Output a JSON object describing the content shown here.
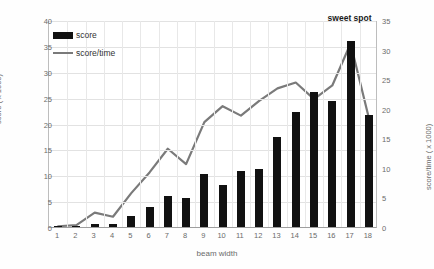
{
  "chart_data": {
    "type": "bar",
    "title": "",
    "xlabel": "beam width",
    "ylabel": "score ( x 1000)",
    "y2label": "score/time ( x 1000)",
    "categories": [
      1,
      2,
      3,
      4,
      5,
      6,
      7,
      8,
      9,
      10,
      11,
      12,
      13,
      14,
      15,
      16,
      17,
      18
    ],
    "xtick_labels": [
      "1",
      "2",
      "3",
      "4",
      "5",
      "6",
      "7",
      "8",
      "9",
      "10",
      "11",
      "12",
      "13",
      "14",
      "15",
      "16",
      "17",
      "18"
    ],
    "ylim": [
      0,
      40
    ],
    "y_ticks": [
      0,
      5,
      10,
      15,
      20,
      25,
      30,
      35,
      40
    ],
    "y_tick_labels": [
      "0",
      "5",
      "10",
      "15",
      "20",
      "25",
      "30",
      "35",
      "40"
    ],
    "y2lim": [
      0,
      35
    ],
    "y2_ticks": [
      0,
      5,
      10,
      15,
      20,
      25,
      30,
      35
    ],
    "y2_tick_labels": [
      "0",
      "5",
      "10",
      "15",
      "20",
      "25",
      "30",
      "35"
    ],
    "grid": true,
    "legend_position": "top-left",
    "series": [
      {
        "name": "score",
        "type": "bar",
        "axis": "left",
        "color": "#111111",
        "values": [
          0.1,
          0.15,
          0.5,
          0.6,
          2.2,
          3.8,
          6.0,
          5.6,
          10.3,
          8.1,
          10.8,
          11.2,
          17.3,
          22.2,
          26.0,
          24.4,
          36.0,
          21.7
        ]
      },
      {
        "name": "score/time",
        "type": "line",
        "axis": "right",
        "color": "#7a7a7a",
        "values": [
          0.3,
          0.5,
          2.6,
          1.9,
          5.9,
          9.4,
          13.4,
          10.8,
          17.9,
          20.6,
          19.0,
          21.5,
          23.6,
          24.6,
          21.8,
          24.1,
          31.2,
          18.6
        ]
      }
    ],
    "annotations": [
      {
        "text": "sweet spot",
        "category": 17,
        "value": 34.0,
        "axis": "right"
      }
    ]
  },
  "legend": {
    "items": [
      {
        "label": "score",
        "marker": "bar-swatch"
      },
      {
        "label": "score/time",
        "marker": "line-swatch"
      }
    ]
  }
}
